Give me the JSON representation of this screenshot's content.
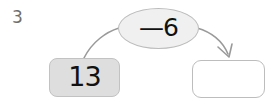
{
  "worksheet": {
    "question_number": "3",
    "type": "function-machine",
    "input_box": {
      "value": "13",
      "fill_color": "#dedede",
      "border_color": "#c2c2c2"
    },
    "operation_oval": {
      "label": "—6",
      "operator": "−",
      "operand": "6",
      "fill_color": "#f0f0f0",
      "border_color": "#bbbbbb"
    },
    "answer_box": {
      "value": "",
      "placeholder": "",
      "fill_color": "#ffffff",
      "border_color": "#bdbdbd"
    },
    "connectors": {
      "input_to_oval": {
        "name": "curve-input-to-oval",
        "has_arrowhead": false,
        "stroke_color": "#9a9a9a"
      },
      "oval_to_answer": {
        "name": "arrow-oval-to-answer",
        "has_arrowhead": true,
        "stroke_color": "#9a9a9a"
      }
    },
    "colors": {
      "question_number": "#6e6e6e",
      "text": "#111111",
      "background": "#ffffff"
    }
  }
}
